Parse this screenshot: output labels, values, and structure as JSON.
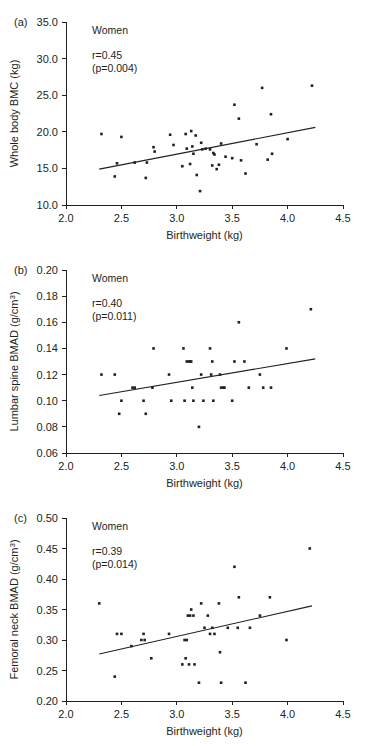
{
  "figure": {
    "name": "birthweight-bone-scatterplots",
    "group_label": "Women"
  },
  "chart_data": [
    {
      "type": "scatter",
      "panel": "(a)",
      "title": "",
      "group": "Women",
      "r_label": "r=0.45",
      "p_label": "(p=0.004)",
      "r": 0.45,
      "p": 0.004,
      "xlabel": "Birthweight (kg)",
      "ylabel": "Whole body BMC (kg)",
      "xlim": [
        2.0,
        4.5
      ],
      "ylim": [
        10.0,
        35.0
      ],
      "xticks": [
        "2.0",
        "2.5",
        "3.0",
        "3.5",
        "4.0",
        "4.5"
      ],
      "yticks": [
        "10.0",
        "15.0",
        "20.0",
        "25.0",
        "30.0",
        "35.0"
      ],
      "grid": false,
      "legend": "none",
      "fit_line": {
        "x": [
          2.3,
          4.25
        ],
        "y": [
          14.9,
          20.6
        ]
      },
      "points": [
        [
          2.32,
          19.7
        ],
        [
          2.44,
          13.9
        ],
        [
          2.46,
          15.7
        ],
        [
          2.5,
          19.3
        ],
        [
          2.62,
          15.8
        ],
        [
          2.72,
          13.7
        ],
        [
          2.73,
          15.8
        ],
        [
          2.79,
          17.9
        ],
        [
          2.8,
          17.3
        ],
        [
          2.94,
          19.6
        ],
        [
          2.97,
          18.2
        ],
        [
          3.05,
          15.3
        ],
        [
          3.08,
          19.7
        ],
        [
          3.09,
          17.7
        ],
        [
          3.12,
          15.6
        ],
        [
          3.13,
          20.1
        ],
        [
          3.14,
          18.0
        ],
        [
          3.15,
          17.0
        ],
        [
          3.17,
          19.5
        ],
        [
          3.18,
          14.1
        ],
        [
          3.21,
          11.9
        ],
        [
          3.22,
          18.5
        ],
        [
          3.23,
          17.6
        ],
        [
          3.26,
          17.7
        ],
        [
          3.3,
          17.6
        ],
        [
          3.32,
          15.4
        ],
        [
          3.33,
          17.1
        ],
        [
          3.34,
          16.9
        ],
        [
          3.36,
          14.9
        ],
        [
          3.38,
          15.5
        ],
        [
          3.4,
          18.4
        ],
        [
          3.44,
          16.6
        ],
        [
          3.5,
          16.4
        ],
        [
          3.52,
          23.7
        ],
        [
          3.56,
          21.8
        ],
        [
          3.58,
          16.1
        ],
        [
          3.62,
          14.3
        ],
        [
          3.72,
          18.3
        ],
        [
          3.77,
          26.0
        ],
        [
          3.82,
          16.2
        ],
        [
          3.85,
          22.4
        ],
        [
          3.86,
          17.0
        ],
        [
          4.0,
          19.0
        ],
        [
          4.22,
          26.3
        ]
      ]
    },
    {
      "type": "scatter",
      "panel": "(b)",
      "title": "",
      "group": "Women",
      "r_label": "r=0.40",
      "p_label": "(p=0.011)",
      "r": 0.4,
      "p": 0.011,
      "xlabel": "Birthweight (kg)",
      "ylabel": "Lumbar spine BMAD (g/cm3)",
      "xlim": [
        2.0,
        4.5
      ],
      "ylim": [
        0.06,
        0.2
      ],
      "xticks": [
        "2.0",
        "2.5",
        "3.0",
        "3.5",
        "4.0",
        "4.5"
      ],
      "yticks": [
        "0.06",
        "0.08",
        "0.10",
        "0.12",
        "0.14",
        "0.16",
        "0.18",
        "0.20"
      ],
      "grid": false,
      "legend": "none",
      "fit_line": {
        "x": [
          2.3,
          4.25
        ],
        "y": [
          0.104,
          0.132
        ]
      },
      "points": [
        [
          2.32,
          0.12
        ],
        [
          2.44,
          0.12
        ],
        [
          2.48,
          0.09
        ],
        [
          2.5,
          0.1
        ],
        [
          2.6,
          0.11
        ],
        [
          2.62,
          0.11
        ],
        [
          2.7,
          0.1
        ],
        [
          2.72,
          0.09
        ],
        [
          2.78,
          0.11
        ],
        [
          2.79,
          0.14
        ],
        [
          2.93,
          0.12
        ],
        [
          2.95,
          0.1
        ],
        [
          3.06,
          0.14
        ],
        [
          3.07,
          0.1
        ],
        [
          3.09,
          0.13
        ],
        [
          3.11,
          0.13
        ],
        [
          3.12,
          0.13
        ],
        [
          3.13,
          0.13
        ],
        [
          3.14,
          0.11
        ],
        [
          3.15,
          0.1
        ],
        [
          3.2,
          0.08
        ],
        [
          3.22,
          0.12
        ],
        [
          3.24,
          0.1
        ],
        [
          3.3,
          0.14
        ],
        [
          3.31,
          0.12
        ],
        [
          3.32,
          0.13
        ],
        [
          3.33,
          0.1
        ],
        [
          3.39,
          0.12
        ],
        [
          3.4,
          0.11
        ],
        [
          3.42,
          0.11
        ],
        [
          3.43,
          0.11
        ],
        [
          3.5,
          0.1
        ],
        [
          3.52,
          0.13
        ],
        [
          3.56,
          0.16
        ],
        [
          3.61,
          0.13
        ],
        [
          3.65,
          0.11
        ],
        [
          3.75,
          0.12
        ],
        [
          3.78,
          0.11
        ],
        [
          3.85,
          0.11
        ],
        [
          3.99,
          0.14
        ],
        [
          4.21,
          0.17
        ]
      ]
    },
    {
      "type": "scatter",
      "panel": "(c)",
      "title": "",
      "group": "Women",
      "r_label": "r=0.39",
      "p_label": "(p=0.014)",
      "r": 0.39,
      "p": 0.014,
      "xlabel": "Birthweight (kg)",
      "ylabel": "Femoral neck BMAD (g/cm3)",
      "xlim": [
        2.0,
        4.5
      ],
      "ylim": [
        0.2,
        0.5
      ],
      "xticks": [
        "2.0",
        "2.5",
        "3.0",
        "3.5",
        "4.0",
        "4.5"
      ],
      "yticks": [
        "0.20",
        "0.25",
        "0.30",
        "0.35",
        "0.40",
        "0.45",
        "0.50"
      ],
      "grid": false,
      "legend": "none",
      "fit_line": {
        "x": [
          2.3,
          4.22
        ],
        "y": [
          0.277,
          0.356
        ]
      },
      "points": [
        [
          2.3,
          0.36
        ],
        [
          2.44,
          0.24
        ],
        [
          2.46,
          0.31
        ],
        [
          2.5,
          0.31
        ],
        [
          2.59,
          0.29
        ],
        [
          2.68,
          0.3
        ],
        [
          2.7,
          0.31
        ],
        [
          2.71,
          0.3
        ],
        [
          2.77,
          0.27
        ],
        [
          2.93,
          0.31
        ],
        [
          3.05,
          0.26
        ],
        [
          3.07,
          0.3
        ],
        [
          3.08,
          0.27
        ],
        [
          3.09,
          0.3
        ],
        [
          3.1,
          0.34
        ],
        [
          3.11,
          0.26
        ],
        [
          3.12,
          0.34
        ],
        [
          3.13,
          0.35
        ],
        [
          3.15,
          0.34
        ],
        [
          3.16,
          0.26
        ],
        [
          3.2,
          0.23
        ],
        [
          3.22,
          0.36
        ],
        [
          3.25,
          0.32
        ],
        [
          3.28,
          0.34
        ],
        [
          3.3,
          0.31
        ],
        [
          3.32,
          0.32
        ],
        [
          3.34,
          0.31
        ],
        [
          3.38,
          0.36
        ],
        [
          3.39,
          0.28
        ],
        [
          3.4,
          0.23
        ],
        [
          3.46,
          0.32
        ],
        [
          3.52,
          0.42
        ],
        [
          3.55,
          0.32
        ],
        [
          3.56,
          0.37
        ],
        [
          3.62,
          0.23
        ],
        [
          3.66,
          0.32
        ],
        [
          3.75,
          0.34
        ],
        [
          3.84,
          0.37
        ],
        [
          3.99,
          0.3
        ],
        [
          4.2,
          0.45
        ]
      ]
    }
  ]
}
